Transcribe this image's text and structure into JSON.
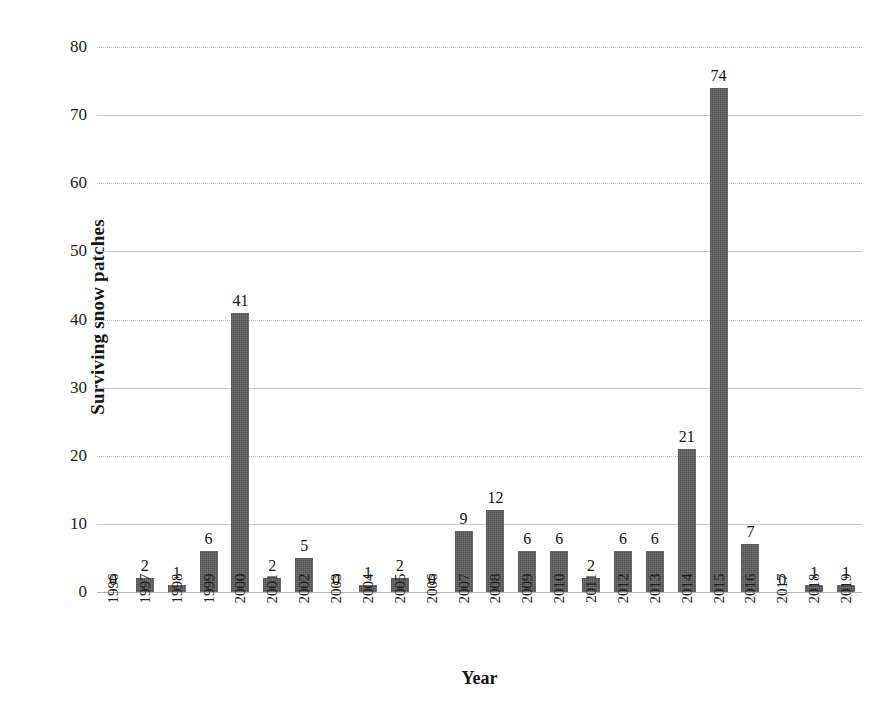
{
  "chart_data": {
    "type": "bar",
    "title": "",
    "xlabel": "Year",
    "ylabel": "Surviving snow patches",
    "categories": [
      "1996",
      "1997",
      "1998",
      "1999",
      "2000",
      "2001",
      "2002",
      "2003",
      "2004",
      "2005",
      "2006",
      "2007",
      "2008",
      "2009",
      "2010",
      "2011",
      "2012",
      "2013",
      "2014",
      "2015",
      "2016",
      "2017",
      "2018",
      "2019"
    ],
    "values": [
      0,
      2,
      1,
      6,
      41,
      2,
      5,
      0,
      1,
      2,
      0,
      9,
      12,
      6,
      6,
      2,
      6,
      6,
      21,
      74,
      7,
      0,
      1,
      1
    ],
    "data_labels": [
      "0",
      "2",
      "1",
      "6",
      "41",
      "2",
      "5",
      "0",
      "1",
      "2",
      "0",
      "9",
      "12",
      "6",
      "6",
      "2",
      "6",
      "6",
      "21",
      "74",
      "7",
      "0",
      "1",
      "1"
    ],
    "ylim": [
      0,
      80
    ],
    "ytick_step": 10,
    "yticks": [
      "0",
      "10",
      "20",
      "30",
      "40",
      "50",
      "60",
      "70",
      "80"
    ],
    "grid": true,
    "grid_axis": "y",
    "legend": "none",
    "series_name": "Surviving snow patches",
    "bar_color": "#595959",
    "gridline_color": "#c9c9c9",
    "text_color": "#1a1a1a",
    "background": "#ffffff"
  }
}
